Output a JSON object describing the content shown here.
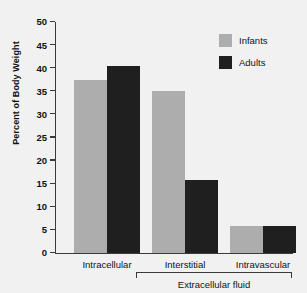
{
  "chart_data": {
    "type": "bar",
    "title": "",
    "subtitle": "",
    "xlabel": "",
    "ylabel": "Percent of Body Weight",
    "categories": [
      "Intracellular",
      "Interstitial",
      "Intravascular"
    ],
    "series": [
      {
        "name": "Infants",
        "color": "#adadad",
        "values": [
          37.5,
          35.0,
          5.8
        ]
      },
      {
        "name": "Adults",
        "color": "#1f1f1f",
        "values": [
          40.5,
          15.7,
          5.8
        ]
      }
    ],
    "ylim": [
      0,
      50
    ],
    "ytick_step": 5,
    "ytick_labels": [
      "50",
      "45",
      "40",
      "35",
      "30",
      "25",
      "20",
      "15",
      "10",
      "5",
      "0"
    ],
    "ytick_values": [
      50,
      45,
      40,
      35,
      30,
      25,
      20,
      15,
      10,
      5,
      0
    ],
    "grid": false,
    "legend_position": "top-right",
    "annotations": [
      {
        "type": "group-bracket",
        "label": "Extracellular fluid",
        "spans": [
          "Interstitial",
          "Intravascular"
        ]
      }
    ]
  },
  "legend": {
    "entries": [
      {
        "label": "Infants",
        "color": "#adadad"
      },
      {
        "label": "Adults",
        "color": "#1f1f1f"
      }
    ]
  },
  "axis": {
    "y_title": "Percent of Body Weight"
  },
  "colors": {
    "background": "#f1f1f1",
    "axis": "#3b3b3b",
    "text": "#111111",
    "infants": "#adadad",
    "adults": "#1f1f1f"
  }
}
